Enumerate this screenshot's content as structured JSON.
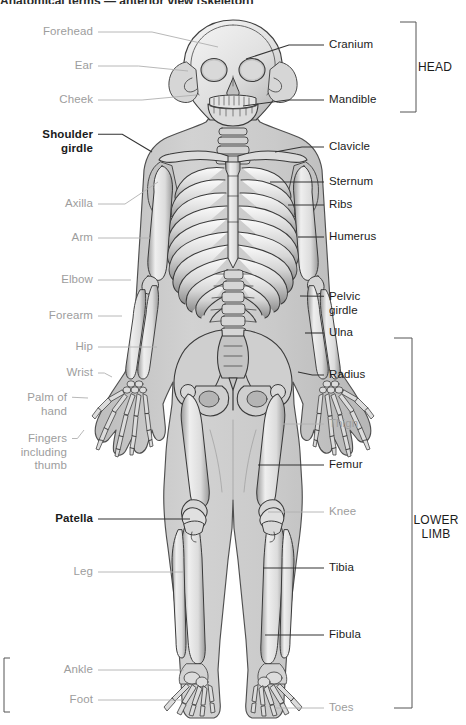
{
  "figure": {
    "title_clipped": "Anatomical terms — anterior view (skeleton)",
    "colors": {
      "regional_label": "#9d9d9d",
      "bone_label": "#1b1b1b",
      "leader_regional": "#b0b0b0",
      "leader_bone": "#333333",
      "bracket": "#555555",
      "body_fill": "#c9c9c9",
      "bone_fill": "#e6e6e6",
      "bone_shade": "#8f8f8f",
      "outline": "#4a4a4a",
      "background": "#ffffff"
    }
  },
  "labels_left": [
    {
      "text": "Forehead",
      "kind": "regional",
      "x": 93,
      "y": 32,
      "tip_x": 218,
      "tip_y": 47,
      "name": "label-forehead"
    },
    {
      "text": "Ear",
      "kind": "regional",
      "x": 93,
      "y": 66,
      "tip_x": 188,
      "tip_y": 71,
      "name": "label-ear"
    },
    {
      "text": "Cheek",
      "kind": "regional",
      "x": 93,
      "y": 100,
      "tip_x": 196,
      "tip_y": 95,
      "name": "label-cheek"
    },
    {
      "text": "Shoulder\ngirdle",
      "kind": "bone",
      "x": 93,
      "y": 141,
      "tip_x": 152,
      "tip_y": 152,
      "name": "label-shoulder-girdle"
    },
    {
      "text": "Axilla",
      "kind": "regional",
      "x": 93,
      "y": 204,
      "tip_x": 158,
      "tip_y": 182,
      "name": "label-axilla"
    },
    {
      "text": "Arm",
      "kind": "regional",
      "x": 93,
      "y": 238,
      "tip_x": 150,
      "tip_y": 238,
      "name": "label-arm"
    },
    {
      "text": "Elbow",
      "kind": "regional",
      "x": 93,
      "y": 280,
      "tip_x": 131,
      "tip_y": 280,
      "name": "label-elbow"
    },
    {
      "text": "Forearm",
      "kind": "regional",
      "x": 93,
      "y": 316,
      "tip_x": 122,
      "tip_y": 316,
      "name": "label-forearm"
    },
    {
      "text": "Hip",
      "kind": "regional",
      "x": 93,
      "y": 347,
      "tip_x": 157,
      "tip_y": 347,
      "name": "label-hip"
    },
    {
      "text": "Wrist",
      "kind": "regional",
      "x": 93,
      "y": 373,
      "tip_x": 112,
      "tip_y": 377,
      "name": "label-wrist"
    },
    {
      "text": "Palm of\nhand",
      "kind": "regional",
      "x": 67,
      "y": 404,
      "tip_x": 88,
      "tip_y": 398,
      "name": "label-palm-of-hand"
    },
    {
      "text": "Fingers\nincluding\nthumb",
      "kind": "regional",
      "x": 67,
      "y": 452,
      "tip_x": 84,
      "tip_y": 430,
      "name": "label-fingers-including-thumb"
    },
    {
      "text": "Patella",
      "kind": "bone",
      "x": 93,
      "y": 519,
      "tip_x": 190,
      "tip_y": 519,
      "name": "label-patella"
    },
    {
      "text": "Leg",
      "kind": "regional",
      "x": 93,
      "y": 572,
      "tip_x": 183,
      "tip_y": 572,
      "name": "label-leg"
    },
    {
      "text": "Ankle",
      "kind": "regional",
      "x": 93,
      "y": 670,
      "tip_x": 184,
      "tip_y": 670,
      "name": "label-ankle"
    },
    {
      "text": "Foot",
      "kind": "regional",
      "x": 93,
      "y": 700,
      "tip_x": 182,
      "tip_y": 700,
      "name": "label-foot"
    }
  ],
  "labels_right": [
    {
      "text": "Cranium",
      "kind": "bone-light",
      "x": 329,
      "y": 45,
      "tip_x": 246,
      "tip_y": 59,
      "name": "label-cranium"
    },
    {
      "text": "Mandible",
      "kind": "bone-light",
      "x": 329,
      "y": 100,
      "tip_x": 243,
      "tip_y": 106,
      "name": "label-mandible"
    },
    {
      "text": "Clavicle",
      "kind": "bone-light",
      "x": 329,
      "y": 147,
      "tip_x": 275,
      "tip_y": 152,
      "name": "label-clavicle"
    },
    {
      "text": "Sternum",
      "kind": "bone-light",
      "x": 329,
      "y": 182,
      "tip_x": 270,
      "tip_y": 182,
      "name": "label-sternum"
    },
    {
      "text": "Ribs",
      "kind": "bone-light",
      "x": 329,
      "y": 205,
      "tip_x": 288,
      "tip_y": 205,
      "name": "label-ribs"
    },
    {
      "text": "Humerus",
      "kind": "bone-light",
      "x": 329,
      "y": 237,
      "tip_x": 298,
      "tip_y": 237,
      "name": "label-humerus"
    },
    {
      "text": "Pelvic\ngirdle",
      "kind": "bone-light",
      "x": 329,
      "y": 303,
      "tip_x": 300,
      "tip_y": 296,
      "name": "label-pelvic-girdle"
    },
    {
      "text": "Ulna",
      "kind": "bone-light",
      "x": 329,
      "y": 333,
      "tip_x": 305,
      "tip_y": 333,
      "name": "label-ulna"
    },
    {
      "text": "Radius",
      "kind": "bone-light",
      "x": 329,
      "y": 375,
      "tip_x": 298,
      "tip_y": 372,
      "name": "label-radius"
    },
    {
      "text": "Thigh",
      "kind": "regional",
      "x": 329,
      "y": 424,
      "tip_x": 282,
      "tip_y": 424,
      "name": "label-thigh"
    },
    {
      "text": "Femur",
      "kind": "bone-light",
      "x": 329,
      "y": 465,
      "tip_x": 258,
      "tip_y": 465,
      "name": "label-femur"
    },
    {
      "text": "Knee",
      "kind": "regional",
      "x": 329,
      "y": 512,
      "tip_x": 268,
      "tip_y": 512,
      "name": "label-knee"
    },
    {
      "text": "Tibia",
      "kind": "bone-light",
      "x": 329,
      "y": 568,
      "tip_x": 263,
      "tip_y": 568,
      "name": "label-tibia"
    },
    {
      "text": "Fibula",
      "kind": "bone-light",
      "x": 329,
      "y": 635,
      "tip_x": 265,
      "tip_y": 635,
      "name": "label-fibula"
    },
    {
      "text": "Toes",
      "kind": "regional",
      "x": 329,
      "y": 708,
      "tip_x": 275,
      "tip_y": 708,
      "name": "label-toes"
    }
  ],
  "brackets": [
    {
      "label": "HEAD",
      "name": "bracket-head",
      "label_x": 435,
      "label_y": 67,
      "x": 416,
      "y_top": 22,
      "y_bottom": 112,
      "arm": 16,
      "arm_dir": "left"
    },
    {
      "label": "LOWER\nLIMB",
      "name": "bracket-lower-limb",
      "label_x": 436,
      "label_y": 527,
      "x": 412,
      "y_top": 338,
      "y_bottom": 708,
      "arm": 18,
      "arm_dir": "left"
    },
    {
      "label": "",
      "name": "bracket-clipped-left",
      "label_x": -40,
      "label_y": 685,
      "x": 4,
      "y_top": 658,
      "y_bottom": 712,
      "arm": 6,
      "arm_dir": "right"
    }
  ]
}
